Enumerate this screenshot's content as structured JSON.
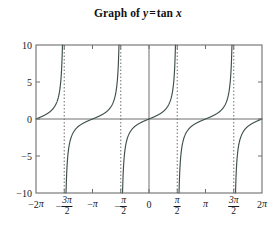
{
  "title": {
    "prefix": "Graph of",
    "lhs": "y",
    "equals": "=",
    "rhs_fn": "tan",
    "rhs_var": "x",
    "full": "Graph of y = tan x"
  },
  "colors": {
    "curve": "#3d4f4c",
    "frame": "#6e6e6e",
    "axis": "#6e6e6e",
    "asymptote": "#7a7a7a",
    "text": "#1a1a1a",
    "background": "#ffffff"
  },
  "chart_data": {
    "type": "line",
    "xlabel": "",
    "ylabel": "",
    "function": "y = tan x",
    "xlim": [
      -6.283185307,
      6.283185307
    ],
    "ylim": [
      -10,
      10
    ],
    "grid": false,
    "legend": null,
    "x_tick_values": [
      -6.283185307,
      -4.71238898,
      -3.141592654,
      -1.570796327,
      0,
      1.570796327,
      3.141592654,
      4.71238898,
      6.283185307
    ],
    "x_tick_labels": [
      "-2π",
      "-3π/2",
      "-π",
      "-π/2",
      "0",
      "π/2",
      "π",
      "3π/2",
      "2π"
    ],
    "y_tick_values": [
      10,
      5,
      0,
      -5,
      -10
    ],
    "y_tick_labels": [
      "10",
      "5",
      "0",
      "-5",
      "-10"
    ],
    "asymptotes": [
      -4.71238898,
      -1.570796327,
      1.570796327,
      4.71238898
    ],
    "branches": [
      {
        "x_range": [
          -6.283185307,
          -4.71238898
        ],
        "note": "from y=0 at -2pi rising to +inf at -3pi/2"
      },
      {
        "x_range": [
          -4.71238898,
          -1.570796327
        ],
        "note": "from -inf at -3pi/2 through y=0 at -pi to +inf at -pi/2"
      },
      {
        "x_range": [
          -1.570796327,
          1.570796327
        ],
        "note": "from -inf at -pi/2 through y=0 at 0 to +inf at pi/2"
      },
      {
        "x_range": [
          1.570796327,
          4.71238898
        ],
        "note": "from -inf at pi/2 through y=0 at pi to +inf at 3pi/2"
      },
      {
        "x_range": [
          4.71238898,
          6.283185307
        ],
        "note": "from -inf at 3pi/2 to y=0 at 2pi"
      }
    ],
    "key_points": [
      {
        "x": -6.283185307,
        "y": 0
      },
      {
        "x": -3.926990817,
        "y": -1
      },
      {
        "x": -3.141592654,
        "y": 0
      },
      {
        "x": -2.35619449,
        "y": 1
      },
      {
        "x": -0.785398163,
        "y": -1
      },
      {
        "x": 0,
        "y": 0
      },
      {
        "x": 0.785398163,
        "y": 1
      },
      {
        "x": 2.35619449,
        "y": -1
      },
      {
        "x": 3.141592654,
        "y": 0
      },
      {
        "x": 3.926990817,
        "y": 1
      },
      {
        "x": 5.497787144,
        "y": -1
      },
      {
        "x": 6.283185307,
        "y": 0
      }
    ]
  },
  "axes": {
    "y_labels": [
      "10",
      "5",
      "0",
      "−5",
      "−10"
    ],
    "x_labels": [
      {
        "lead": "−2",
        "pi": "π",
        "frac": false
      },
      {
        "lead": "−",
        "num": "3π",
        "den": "2",
        "frac": true
      },
      {
        "lead": "−",
        "pi": "π",
        "frac": false
      },
      {
        "lead": "−",
        "num": "π",
        "den": "2",
        "frac": true
      },
      {
        "lead": "0",
        "frac": false
      },
      {
        "lead": "",
        "num": "π",
        "den": "2",
        "frac": true
      },
      {
        "lead": "",
        "pi": "π",
        "frac": false
      },
      {
        "lead": "",
        "num": "3π",
        "den": "2",
        "frac": true
      },
      {
        "lead": "2",
        "pi": "π",
        "frac": false
      }
    ]
  },
  "plot_box": {
    "left": 36,
    "right": 262,
    "top": 45,
    "bottom": 193
  }
}
